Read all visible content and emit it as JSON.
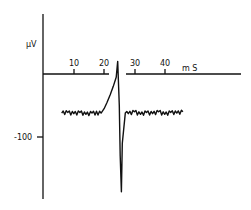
{
  "chart_data": {
    "type": "line",
    "title": "",
    "xlabel": "mS",
    "ylabel": "µV",
    "x_ticks": [
      10,
      20,
      30,
      40
    ],
    "y_ticks": [
      -100
    ],
    "xlim": [
      0,
      66
    ],
    "ylim": [
      -200,
      95
    ],
    "grid": false,
    "legend": null,
    "series": [
      {
        "name": "recorded potential",
        "x": [
          6,
          8,
          10,
          12,
          14,
          16,
          19,
          20,
          21,
          22,
          23,
          24,
          24.5,
          25,
          25.3,
          25.7,
          26,
          27,
          28,
          30,
          32,
          34,
          36,
          38,
          40,
          42,
          44,
          46
        ],
        "y": [
          -62,
          -61,
          -63,
          -61,
          -64,
          -62,
          -62,
          -55,
          -45,
          -33,
          -20,
          -5,
          20,
          -50,
          -130,
          -187,
          -110,
          -62,
          -63,
          -60,
          -64,
          -61,
          -63,
          -60,
          -64,
          -61,
          -62,
          -60
        ]
      }
    ],
    "annotations": {
      "baseline_uV": -62,
      "peak_uV": 22,
      "trough_uV": -187,
      "spike_time_ms": 25
    }
  },
  "labels": {
    "y_unit": "µV",
    "x_unit": "m S",
    "x_tick_10": "10",
    "x_tick_20": "20",
    "x_tick_30": "30",
    "x_tick_40": "40",
    "y_tick_neg100": "-100"
  }
}
